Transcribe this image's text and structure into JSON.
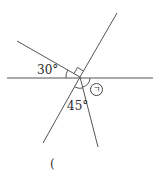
{
  "diagram": {
    "type": "intersecting-lines-angles",
    "labels": {
      "angle_left": "30°",
      "angle_bottom": "45°",
      "unknown_angle": "ㄱ",
      "answer_paren": "("
    },
    "colors": {
      "line": "#555555",
      "text": "#2a2a2a"
    }
  }
}
